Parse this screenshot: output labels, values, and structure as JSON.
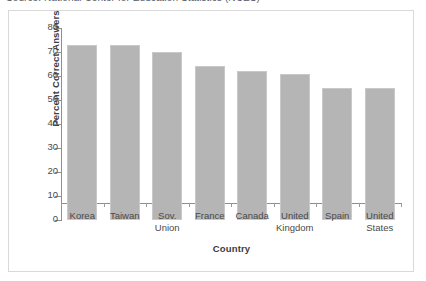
{
  "source_note": "Source: National Center for Education Statistics (NCES)",
  "chart_data": {
    "type": "bar",
    "title": "",
    "xlabel": "Country",
    "ylabel": "Percent Correct Answers",
    "categories": [
      "Korea",
      "Taiwan",
      "Sov. Union",
      "France",
      "Canada",
      "United Kingdom",
      "Spain",
      "United States"
    ],
    "category_lines": [
      [
        "Korea"
      ],
      [
        "Taiwan"
      ],
      [
        "Sov.",
        "Union"
      ],
      [
        "France"
      ],
      [
        "Canada"
      ],
      [
        "United",
        "Kingdom"
      ],
      [
        "Spain"
      ],
      [
        "United",
        "States"
      ]
    ],
    "values": [
      73,
      73,
      70,
      64,
      62,
      61,
      55,
      55
    ],
    "ylim": [
      0,
      80
    ],
    "ytick_labels": [
      "0",
      "10",
      "20",
      "30",
      "40",
      "50",
      "60",
      "70",
      "80"
    ],
    "ytick_values": [
      0,
      10,
      20,
      30,
      40,
      50,
      60,
      70,
      80
    ],
    "grid": false,
    "legend": "none",
    "bar_color": "#b5b5b5",
    "bar_border_color": "#c9c9c9",
    "axis_color": "#8e8e8e",
    "frame_color": "#d9d9d9",
    "background": "#ffffff"
  }
}
